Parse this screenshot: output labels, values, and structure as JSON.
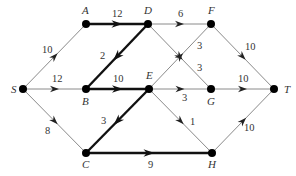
{
  "diagram": {
    "type": "network-flow-graph",
    "colors": {
      "thin_edge": "#8a8a8a",
      "thick_edge": "#111111",
      "node": "#000000",
      "text": "#333333"
    },
    "nodes": [
      {
        "id": "S",
        "label": "S",
        "x": 23,
        "y": 89,
        "lx": 11,
        "ly": 93
      },
      {
        "id": "A",
        "label": "A",
        "x": 86,
        "y": 24,
        "lx": 82,
        "ly": 14
      },
      {
        "id": "B",
        "label": "B",
        "x": 86,
        "y": 89,
        "lx": 82,
        "ly": 105
      },
      {
        "id": "C",
        "label": "C",
        "x": 86,
        "y": 153,
        "lx": 82,
        "ly": 168
      },
      {
        "id": "D",
        "label": "D",
        "x": 148,
        "y": 24,
        "lx": 144,
        "ly": 14
      },
      {
        "id": "E",
        "label": "E",
        "x": 149,
        "y": 89,
        "lx": 146,
        "ly": 79
      },
      {
        "id": "F",
        "label": "F",
        "x": 211,
        "y": 24,
        "lx": 208,
        "ly": 14
      },
      {
        "id": "G",
        "label": "G",
        "x": 211,
        "y": 89,
        "lx": 207,
        "ly": 105
      },
      {
        "id": "H",
        "label": "H",
        "x": 212,
        "y": 153,
        "lx": 208,
        "ly": 168
      },
      {
        "id": "T",
        "label": "T",
        "x": 274,
        "y": 89,
        "lx": 284,
        "ly": 93
      }
    ],
    "edges": [
      {
        "from": "S",
        "to": "A",
        "weight": "10",
        "bold": false,
        "lx": 42,
        "ly": 53
      },
      {
        "from": "S",
        "to": "B",
        "weight": "12",
        "bold": false,
        "lx": 52,
        "ly": 82
      },
      {
        "from": "S",
        "to": "C",
        "weight": "8",
        "bold": false,
        "lx": 45,
        "ly": 134
      },
      {
        "from": "A",
        "to": "D",
        "weight": "12",
        "bold": true,
        "lx": 112,
        "ly": 17
      },
      {
        "from": "D",
        "to": "B",
        "weight": "2",
        "bold": true,
        "lx": 100,
        "ly": 59
      },
      {
        "from": "D",
        "to": "F",
        "weight": "6",
        "bold": false,
        "lx": 178,
        "ly": 17
      },
      {
        "from": "D",
        "to": "G",
        "weight": "3",
        "bold": false,
        "lx": 197,
        "ly": 71
      },
      {
        "from": "B",
        "to": "E",
        "weight": "10",
        "bold": true,
        "lx": 113,
        "ly": 82
      },
      {
        "from": "E",
        "to": "F",
        "weight": "3",
        "bold": false,
        "lx": 197,
        "ly": 49
      },
      {
        "from": "E",
        "to": "G",
        "weight": "3",
        "bold": false,
        "lx": 182,
        "ly": 101
      },
      {
        "from": "E",
        "to": "C",
        "weight": "3",
        "bold": true,
        "lx": 101,
        "ly": 124
      },
      {
        "from": "E",
        "to": "H",
        "weight": "1",
        "bold": false,
        "lx": 190,
        "ly": 125
      },
      {
        "from": "F",
        "to": "T",
        "weight": "10",
        "bold": false,
        "lx": 245,
        "ly": 50
      },
      {
        "from": "G",
        "to": "T",
        "weight": "10",
        "bold": false,
        "lx": 238,
        "ly": 82
      },
      {
        "from": "C",
        "to": "H",
        "weight": "9",
        "bold": true,
        "lx": 148,
        "ly": 168
      },
      {
        "from": "H",
        "to": "T",
        "weight": "10",
        "bold": false,
        "lx": 244,
        "ly": 131
      }
    ]
  }
}
